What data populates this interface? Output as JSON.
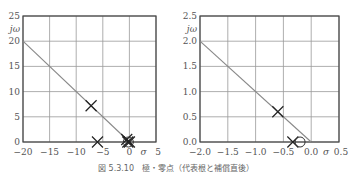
{
  "chart_data": [
    {
      "type": "scatter",
      "title": "",
      "xlabel": "σ",
      "ylabel": "jω",
      "xlim": [
        -20,
        5
      ],
      "ylim": [
        0,
        25
      ],
      "xticks": [
        -20,
        -15,
        -10,
        -5,
        0,
        5
      ],
      "xtick_labels": [
        "−20",
        "−15",
        "−10",
        "−5",
        "0",
        "5"
      ],
      "yticks": [
        0,
        5,
        10,
        15,
        20,
        25
      ],
      "ytick_labels": [
        "0",
        "5",
        "10",
        "15",
        "20",
        "25"
      ],
      "grid": true,
      "lines": [
        {
          "name": "damping line",
          "points": [
            [
              -20,
              20
            ],
            [
              0,
              0
            ]
          ]
        }
      ],
      "poles": [
        [
          -7.2,
          7.2
        ],
        [
          -6,
          0
        ],
        [
          -0.5,
          0.5
        ],
        [
          -0.3,
          0
        ],
        [
          0,
          0
        ]
      ],
      "zeros": [
        [
          -0.2,
          0
        ]
      ]
    },
    {
      "type": "scatter",
      "title": "",
      "xlabel": "σ",
      "ylabel": "jω",
      "xlim": [
        -2.0,
        0.5
      ],
      "ylim": [
        0,
        2.5
      ],
      "xticks": [
        -2.0,
        -1.5,
        -1.0,
        -0.5,
        0.0,
        0.5
      ],
      "xtick_labels": [
        "−2.0",
        "−1.5",
        "−1.0",
        "−0.5",
        "0.0",
        "0.5"
      ],
      "yticks": [
        0.0,
        0.5,
        1.0,
        1.5,
        2.0,
        2.5
      ],
      "ytick_labels": [
        "0.0",
        "0.5",
        "1.0",
        "1.5",
        "2.0",
        "2.5"
      ],
      "grid": true,
      "lines": [
        {
          "name": "damping line",
          "points": [
            [
              -2.0,
              2.0
            ],
            [
              0.0,
              0.0
            ]
          ]
        }
      ],
      "poles": [
        [
          -0.6,
          0.6
        ],
        [
          -0.33,
          0
        ]
      ],
      "zeros": [
        [
          -0.2,
          0
        ]
      ]
    }
  ],
  "caption": "図 5.3.10　極・零点（代表根と補償直後）"
}
